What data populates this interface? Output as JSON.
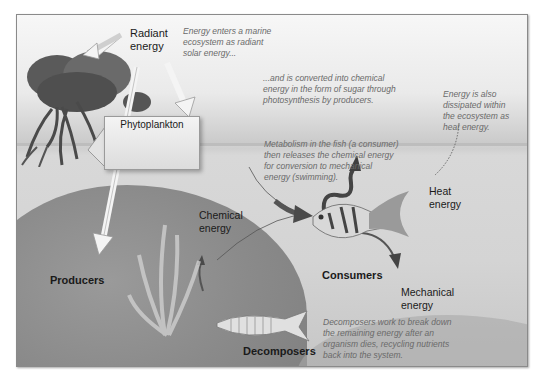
{
  "diagram": {
    "labels": {
      "radiant_energy_line1": "Radiant",
      "radiant_energy_line2": "energy",
      "phytoplankton": "Phytoplankton",
      "producers": "Producers",
      "chemical_energy_line1": "Chemical",
      "chemical_energy_line2": "energy",
      "consumers": "Consumers",
      "heat_energy_line1": "Heat",
      "heat_energy_line2": "energy",
      "mechanical_energy_line1": "Mechanical",
      "mechanical_energy_line2": "energy",
      "decomposers": "Decomposers"
    },
    "notes": {
      "solar": [
        "Energy enters a marine",
        "ecosystem as radiant",
        "solar energy..."
      ],
      "photosynthesis": [
        "...and is converted into chemical",
        "energy in the form of sugar through",
        "photosynthesis by producers."
      ],
      "dissipation": [
        "Energy is also",
        "dissipated within",
        "the ecosystem as",
        "heat energy."
      ],
      "metabolism": [
        "Metabolism in the fish (a consumer)",
        "then releases the chemical energy",
        "for conversion to mechanical",
        "energy (swimming)."
      ],
      "decomposition": [
        "Decomposers work to break down",
        "the remaining energy after an",
        "organism dies, recycling nutrients",
        "back into the system."
      ]
    },
    "colors": {
      "frame_border": "#8a8a8a",
      "label_text": "#1a1a1a",
      "note_text": "#6a6a6a",
      "arrow_light": "#f0f0f0",
      "arrow_dark": "#4a4a4a"
    }
  }
}
